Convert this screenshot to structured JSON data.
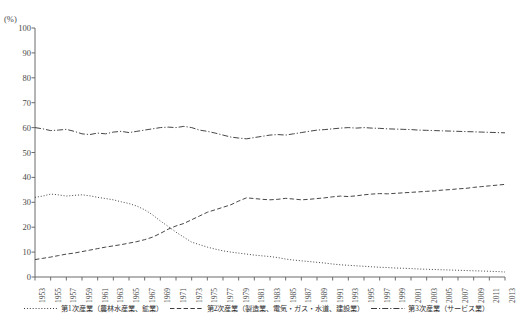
{
  "title_partial": "",
  "axis": {
    "y_unit": "(%)",
    "y_ticks": [
      0,
      10,
      20,
      30,
      40,
      50,
      60,
      70,
      80,
      90,
      100
    ],
    "x_tick_labels": [
      "1953",
      "1955",
      "1957",
      "1959",
      "1961",
      "1963",
      "1965",
      "1967",
      "1969",
      "1971",
      "1973",
      "1975",
      "1977",
      "1979",
      "1981",
      "1983",
      "1985",
      "1987",
      "1989",
      "1991",
      "1993",
      "1995",
      "1997",
      "1999",
      "2001",
      "2003",
      "2005",
      "2007",
      "2009",
      "2011",
      "2013"
    ]
  },
  "legend": {
    "items": [
      {
        "label": "第1次産業（農林水産業、鉱業）",
        "style": "dotted",
        "icon": "dotted-line-icon"
      },
      {
        "label": "第2次産業（製造業、電気・ガス・水道、建設業）",
        "style": "dashed",
        "icon": "dashed-line-icon"
      },
      {
        "label": "第3次産業（サービス業）",
        "style": "dash-dot",
        "icon": "dash-dot-line-icon"
      }
    ]
  },
  "colors": {
    "line": "#3c3c3c",
    "axis": "#6b6b6b",
    "text": "#3a3a3a"
  },
  "chart_data": {
    "type": "line",
    "title": "",
    "xlabel": "",
    "ylabel": "(%)",
    "ylim": [
      0,
      100
    ],
    "grid": false,
    "legend_position": "bottom",
    "x": [
      1953,
      1954,
      1955,
      1956,
      1957,
      1958,
      1959,
      1960,
      1961,
      1962,
      1963,
      1964,
      1965,
      1966,
      1967,
      1968,
      1969,
      1970,
      1971,
      1972,
      1973,
      1974,
      1975,
      1976,
      1977,
      1978,
      1979,
      1980,
      1981,
      1982,
      1983,
      1984,
      1985,
      1986,
      1987,
      1988,
      1989,
      1990,
      1991,
      1992,
      1993,
      1994,
      1995,
      1996,
      1997,
      1998,
      1999,
      2000,
      2001,
      2002,
      2003,
      2004,
      2005,
      2006,
      2007,
      2008,
      2009,
      2010,
      2011,
      2012,
      2013
    ],
    "series": [
      {
        "name": "第1次産業（農林水産業、鉱業）",
        "style": "dotted",
        "values": [
          32.0,
          32.5,
          33.3,
          33.0,
          32.5,
          32.8,
          33.0,
          32.6,
          32.0,
          31.5,
          31.0,
          30.2,
          29.5,
          28.5,
          27.0,
          25.0,
          22.5,
          20.3,
          18.0,
          16.0,
          14.0,
          13.0,
          12.0,
          11.2,
          10.5,
          10.0,
          9.6,
          9.2,
          8.8,
          8.5,
          8.2,
          7.8,
          7.2,
          6.8,
          6.5,
          6.2,
          5.9,
          5.6,
          5.2,
          4.9,
          4.7,
          4.5,
          4.3,
          4.1,
          3.9,
          3.8,
          3.6,
          3.5,
          3.4,
          3.2,
          3.1,
          3.0,
          2.9,
          2.8,
          2.7,
          2.6,
          2.5,
          2.4,
          2.3,
          2.2,
          2.0
        ]
      },
      {
        "name": "第2次産業（製造業、電気・ガス・水道、建設業）",
        "style": "dashed",
        "values": [
          7.0,
          7.5,
          8.0,
          8.6,
          9.2,
          9.6,
          10.2,
          10.8,
          11.4,
          12.0,
          12.5,
          13.0,
          13.6,
          14.2,
          15.0,
          16.0,
          17.5,
          19.2,
          20.5,
          21.5,
          23.0,
          24.5,
          26.0,
          27.0,
          28.0,
          29.0,
          30.5,
          31.8,
          31.5,
          31.2,
          31.0,
          31.2,
          31.6,
          31.3,
          31.0,
          31.2,
          31.5,
          31.8,
          32.2,
          32.5,
          32.3,
          32.6,
          33.0,
          33.3,
          33.5,
          33.4,
          33.6,
          33.8,
          34.0,
          34.2,
          34.4,
          34.6,
          34.9,
          35.1,
          35.4,
          35.6,
          36.0,
          36.3,
          36.6,
          36.9,
          37.2
        ]
      },
      {
        "name": "第3次産業（サービス業）",
        "style": "dash-dot",
        "values": [
          60.0,
          59.5,
          58.8,
          59.0,
          59.3,
          58.5,
          57.5,
          57.2,
          57.8,
          57.5,
          58.2,
          58.5,
          58.0,
          58.5,
          59.0,
          59.5,
          60.0,
          60.2,
          60.0,
          60.5,
          60.0,
          59.0,
          58.5,
          57.8,
          57.0,
          56.2,
          55.8,
          55.5,
          56.0,
          56.5,
          57.0,
          57.2,
          57.0,
          57.5,
          58.0,
          58.5,
          59.0,
          59.2,
          59.5,
          59.8,
          60.0,
          59.8,
          60.0,
          59.8,
          59.7,
          59.5,
          59.4,
          59.3,
          59.2,
          59.0,
          58.9,
          58.8,
          58.7,
          58.6,
          58.5,
          58.4,
          58.3,
          58.2,
          58.1,
          58.0,
          57.9
        ]
      }
    ]
  }
}
